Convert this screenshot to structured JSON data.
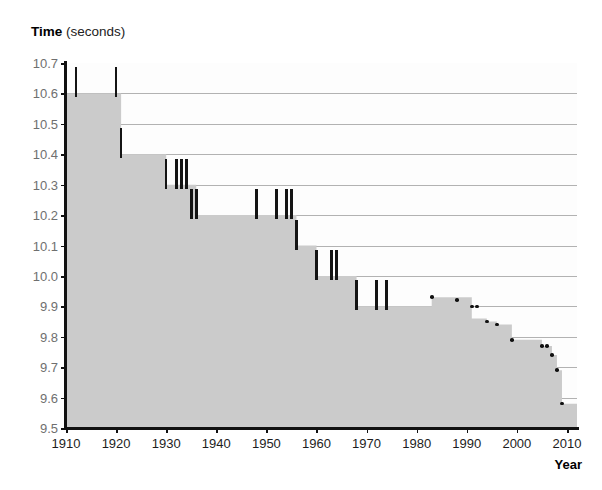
{
  "chart_data": {
    "type": "area",
    "title_bold_part": "Time",
    "title_regular_part": "(seconds)",
    "xlabel": "Year",
    "ylabel": "Time (seconds)",
    "xlim": [
      1910,
      2012
    ],
    "ylim": [
      9.5,
      10.7
    ],
    "grid": true,
    "legend": null,
    "y_ticks": [
      "10.7",
      "10.6",
      "10.5",
      "10.4",
      "10.3",
      "10.2",
      "10.1",
      "10.0",
      "9.9",
      "9.8",
      "9.7",
      "9.6",
      "9.5"
    ],
    "y_tick_values": [
      10.7,
      10.6,
      10.5,
      10.4,
      10.3,
      10.2,
      10.1,
      10.0,
      9.9,
      9.8,
      9.7,
      9.6,
      9.5
    ],
    "x_ticks": [
      "1910",
      "1920",
      "1930",
      "1940",
      "1950",
      "1960",
      "1970",
      "1980",
      "1990",
      "2000",
      "2010"
    ],
    "x_tick_values": [
      1910,
      1920,
      1930,
      1940,
      1950,
      1960,
      1970,
      1980,
      1990,
      2000,
      2010
    ],
    "marker_style_note": "vertical-bar markers before ~1978, small dot markers after",
    "records": [
      {
        "year": 1912,
        "value": 10.6
      },
      {
        "year": 1921,
        "value": 10.4
      },
      {
        "year": 1930,
        "value": 10.3
      },
      {
        "year": 1936,
        "value": 10.2
      },
      {
        "year": 1956,
        "value": 10.1
      },
      {
        "year": 1960,
        "value": 10.0
      },
      {
        "year": 1968,
        "value": 9.9
      },
      {
        "year": 1983,
        "value": 9.93
      },
      {
        "year": 1991,
        "value": 9.86
      },
      {
        "year": 1994,
        "value": 9.85
      },
      {
        "year": 1996,
        "value": 9.84
      },
      {
        "year": 1999,
        "value": 9.79
      },
      {
        "year": 2005,
        "value": 9.77
      },
      {
        "year": 2007,
        "value": 9.74
      },
      {
        "year": 2008,
        "value": 9.69
      },
      {
        "year": 2009,
        "value": 9.58
      }
    ],
    "record_marks": [
      {
        "year": 1912,
        "value": 10.6
      },
      {
        "year": 1920,
        "value": 10.6
      },
      {
        "year": 1921,
        "value": 10.4
      },
      {
        "year": 1930,
        "value": 10.3
      },
      {
        "year": 1932,
        "value": 10.3
      },
      {
        "year": 1933,
        "value": 10.3
      },
      {
        "year": 1934,
        "value": 10.3
      },
      {
        "year": 1935,
        "value": 10.2
      },
      {
        "year": 1936,
        "value": 10.2
      },
      {
        "year": 1948,
        "value": 10.2
      },
      {
        "year": 1952,
        "value": 10.2
      },
      {
        "year": 1954,
        "value": 10.2
      },
      {
        "year": 1955,
        "value": 10.2
      },
      {
        "year": 1956,
        "value": 10.1
      },
      {
        "year": 1960,
        "value": 10.0
      },
      {
        "year": 1963,
        "value": 10.0
      },
      {
        "year": 1964,
        "value": 10.0
      },
      {
        "year": 1968,
        "value": 9.9
      },
      {
        "year": 1972,
        "value": 9.9
      },
      {
        "year": 1974,
        "value": 9.9
      },
      {
        "year": 1983,
        "value": 9.93
      },
      {
        "year": 1988,
        "value": 9.92
      },
      {
        "year": 1991,
        "value": 9.9
      },
      {
        "year": 1992,
        "value": 9.9
      },
      {
        "year": 1994,
        "value": 9.85
      },
      {
        "year": 1996,
        "value": 9.84
      },
      {
        "year": 1999,
        "value": 9.79
      },
      {
        "year": 2005,
        "value": 9.77
      },
      {
        "year": 2006,
        "value": 9.77
      },
      {
        "year": 2007,
        "value": 9.74
      },
      {
        "year": 2008,
        "value": 9.69
      },
      {
        "year": 2009,
        "value": 9.58
      }
    ],
    "colors": {
      "area_fill": "#cbcbcb",
      "plot_background": "#fdfdfd",
      "gridline": "#b2b2b2",
      "axis": "#111111",
      "marker": "#141414",
      "y_tick_label": "#6f6f6f",
      "x_tick_label": "#1d1d1d"
    }
  }
}
